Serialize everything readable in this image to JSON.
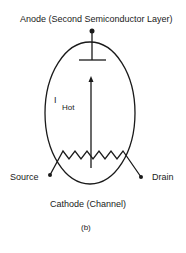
{
  "diagram": {
    "labels": {
      "anode": "Anode (Second Semiconductor Layer)",
      "current_main": "I",
      "current_sub": "Hot",
      "source": "Source",
      "drain": "Drain",
      "cathode": "Cathode  (Channel)",
      "caption": "(b)"
    },
    "colors": {
      "stroke": "#1a1a1a",
      "background": "#ffffff"
    }
  }
}
